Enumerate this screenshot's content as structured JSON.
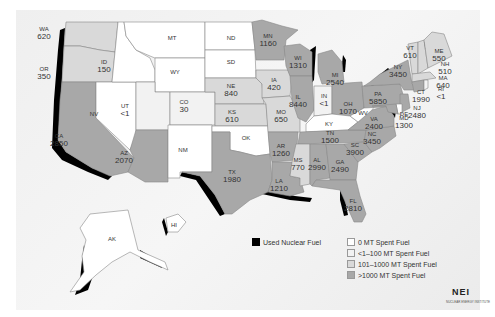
{
  "colors": {
    "zero": "#ffffff",
    "low": "#f2f2f2",
    "mid": "#d9d9d9",
    "high": "#a8a8a8",
    "used_fuel": "#000000"
  },
  "states": [
    {
      "abbr": "WA",
      "value": "620",
      "x": 44,
      "y": 33
    },
    {
      "abbr": "OR",
      "value": "350",
      "x": 44,
      "y": 73
    },
    {
      "abbr": "ID",
      "value": "150",
      "x": 104,
      "y": 66
    },
    {
      "abbr": "MT",
      "value": "",
      "x": 172,
      "y": 38
    },
    {
      "abbr": "ND",
      "value": "",
      "x": 231,
      "y": 38
    },
    {
      "abbr": "SD",
      "value": "",
      "x": 231,
      "y": 62
    },
    {
      "abbr": "WY",
      "value": "",
      "x": 175,
      "y": 72
    },
    {
      "abbr": "NE",
      "value": "840",
      "x": 231,
      "y": 90
    },
    {
      "abbr": "CA",
      "value": "2850",
      "x": 59,
      "y": 140
    },
    {
      "abbr": "NV",
      "value": "",
      "x": 94,
      "y": 114
    },
    {
      "abbr": "UT",
      "value": "<1",
      "x": 125,
      "y": 110
    },
    {
      "abbr": "CO",
      "value": "30",
      "x": 184,
      "y": 106
    },
    {
      "abbr": "AZ",
      "value": "2070",
      "x": 124,
      "y": 157
    },
    {
      "abbr": "NM",
      "value": "",
      "x": 183,
      "y": 150
    },
    {
      "abbr": "KS",
      "value": "610",
      "x": 232,
      "y": 116
    },
    {
      "abbr": "OK",
      "value": "",
      "x": 246,
      "y": 138
    },
    {
      "abbr": "TX",
      "value": "1980",
      "x": 232,
      "y": 176
    },
    {
      "abbr": "MN",
      "value": "1160",
      "x": 268,
      "y": 40
    },
    {
      "abbr": "IA",
      "value": "420",
      "x": 274,
      "y": 84
    },
    {
      "abbr": "MO",
      "value": "650",
      "x": 281,
      "y": 116
    },
    {
      "abbr": "AR",
      "value": "1260",
      "x": 281,
      "y": 150
    },
    {
      "abbr": "LA",
      "value": "1210",
      "x": 279,
      "y": 185
    },
    {
      "abbr": "WI",
      "value": "1310",
      "x": 298,
      "y": 62
    },
    {
      "abbr": "IL",
      "value": "8440",
      "x": 298,
      "y": 101
    },
    {
      "abbr": "MI",
      "value": "2540",
      "x": 335,
      "y": 79
    },
    {
      "abbr": "IN",
      "value": "<1",
      "x": 324,
      "y": 100
    },
    {
      "abbr": "OH",
      "value": "1070",
      "x": 348,
      "y": 108
    },
    {
      "abbr": "KY",
      "value": "",
      "x": 329,
      "y": 124
    },
    {
      "abbr": "TN",
      "value": "1500",
      "x": 330,
      "y": 137
    },
    {
      "abbr": "MS",
      "value": "770",
      "x": 298,
      "y": 164
    },
    {
      "abbr": "AL",
      "value": "2990",
      "x": 317,
      "y": 164
    },
    {
      "abbr": "GA",
      "value": "2490",
      "x": 340,
      "y": 166
    },
    {
      "abbr": "FL",
      "value": "2810",
      "x": 353,
      "y": 205
    },
    {
      "abbr": "SC",
      "value": "3900",
      "x": 355,
      "y": 149
    },
    {
      "abbr": "NC",
      "value": "3450",
      "x": 372,
      "y": 138
    },
    {
      "abbr": "VA",
      "value": "2400",
      "x": 374,
      "y": 123
    },
    {
      "abbr": "WV",
      "value": "",
      "x": 363,
      "y": 113
    },
    {
      "abbr": "PA",
      "value": "5850",
      "x": 378,
      "y": 98
    },
    {
      "abbr": "NY",
      "value": "3450",
      "x": 398,
      "y": 71
    },
    {
      "abbr": "VT",
      "value": "610",
      "x": 410,
      "y": 52
    },
    {
      "abbr": "ME",
      "value": "550",
      "x": 439,
      "y": 55
    },
    {
      "abbr": "NH",
      "value": "510",
      "x": 445,
      "y": 68
    },
    {
      "abbr": "MA",
      "value": "640",
      "x": 443,
      "y": 82
    },
    {
      "abbr": "CT",
      "value": "1990",
      "x": 421,
      "y": 96
    },
    {
      "abbr": "RI",
      "value": "<1",
      "x": 441,
      "y": 93
    },
    {
      "abbr": "NJ",
      "value": "2480",
      "x": 417,
      "y": 112
    },
    {
      "abbr": "DE",
      "value": "",
      "x": 404,
      "y": 114
    },
    {
      "abbr": "MD",
      "value": "1300",
      "x": 404,
      "y": 122
    },
    {
      "abbr": "AK",
      "value": "",
      "x": 112,
      "y": 239
    },
    {
      "abbr": "HI",
      "value": "",
      "x": 174,
      "y": 225
    }
  ],
  "legend": {
    "used_fuel": "Used Nuclear Fuel",
    "items": [
      {
        "label": "0 MT Spent Fuel",
        "color": "#ffffff"
      },
      {
        "label": "<1–100 MT Spent Fuel",
        "color": "#f2f2f2"
      },
      {
        "label": "101–1000 MT Spent Fuel",
        "color": "#d9d9d9"
      },
      {
        "label": ">1000 MT Spent Fuel",
        "color": "#a8a8a8"
      }
    ]
  },
  "logo": {
    "text": "NEI",
    "subtitle": "NUCLEAR ENERGY INSTITUTE"
  }
}
